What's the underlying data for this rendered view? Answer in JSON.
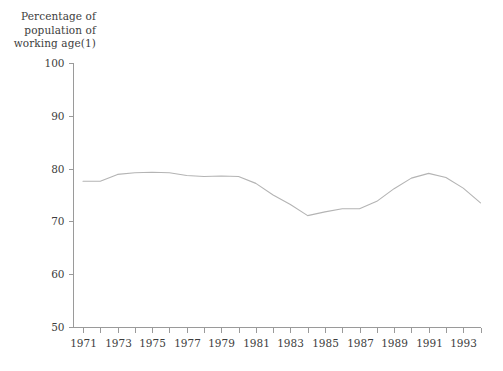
{
  "chart_data": {
    "type": "line",
    "title": "Percentage of\npopulation of\nworking age(1)",
    "title_lines": [
      "Percentage of",
      "population of",
      "working age(1)"
    ],
    "xlabel": "",
    "ylabel": "",
    "ylim": [
      50,
      100
    ],
    "xlim": [
      1971,
      1994
    ],
    "y_ticks": [
      50,
      60,
      70,
      80,
      90,
      100
    ],
    "y_tick_labels": [
      "50",
      "60",
      "70",
      "80",
      "90",
      "100"
    ],
    "x_ticks": [
      1971,
      1972,
      1973,
      1974,
      1975,
      1976,
      1977,
      1978,
      1979,
      1980,
      1981,
      1982,
      1983,
      1984,
      1985,
      1986,
      1987,
      1988,
      1989,
      1990,
      1991,
      1992,
      1993,
      1994
    ],
    "x_tick_labels": [
      "1971",
      "",
      "1973",
      "",
      "1975",
      "",
      "1977",
      "",
      "1979",
      "",
      "1981",
      "",
      "1983",
      "",
      "1985",
      "",
      "1987",
      "",
      "1989",
      "",
      "1991",
      "",
      "1993",
      ""
    ],
    "grid": false,
    "legend": false,
    "line_color": "#b4b4b4",
    "axis_color": "#9a9a9a",
    "series": [
      {
        "name": "Percentage of population of working age",
        "x": [
          1971,
          1972,
          1973,
          1974,
          1975,
          1976,
          1977,
          1978,
          1979,
          1980,
          1981,
          1982,
          1983,
          1984,
          1985,
          1986,
          1987,
          1988,
          1989,
          1990,
          1991,
          1992,
          1993,
          1994
        ],
        "values": [
          77.6,
          77.6,
          78.9,
          79.2,
          79.3,
          79.2,
          78.7,
          78.5,
          78.6,
          78.5,
          77.2,
          75.0,
          73.2,
          71.1,
          71.8,
          72.4,
          72.4,
          73.8,
          76.2,
          78.2,
          79.1,
          78.3,
          76.3,
          73.5
        ]
      }
    ]
  }
}
